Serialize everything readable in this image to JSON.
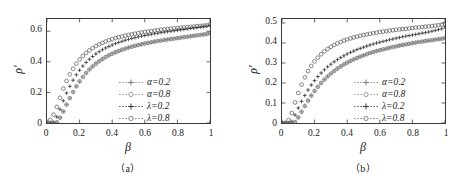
{
  "figure": {
    "background": "#ffffff",
    "axis_color": "#3a3a3a",
    "marker_dark": "#222222",
    "marker_gray": "#6f6f6f",
    "marker_open": "#555555"
  },
  "panels": [
    {
      "id": "panel-a",
      "caption": "（a）",
      "xlabel": "β",
      "ylabel": "ρ′",
      "xticks": [
        "0",
        "0.2",
        "0.4",
        "0.6",
        "0.8",
        "1"
      ],
      "yticks": [
        "0",
        "0.2",
        "0.4",
        "0.6"
      ],
      "legend": [
        {
          "label": "α=0.2",
          "marker": "plus-marker",
          "color": "#6f6f6f"
        },
        {
          "label": "α=0.8",
          "marker": "circle-marker",
          "color": "#777777"
        },
        {
          "label": "λ=0.2",
          "marker": "plus-marker",
          "color": "#222222"
        },
        {
          "label": "λ=0.8",
          "marker": "circle-marker",
          "color": "#555555"
        }
      ]
    },
    {
      "id": "panel-b",
      "caption": "（b）",
      "xlabel": "β",
      "ylabel": "ρ′",
      "xticks": [
        "0",
        "0.2",
        "0.4",
        "0.6",
        "0.8",
        "1"
      ],
      "yticks": [
        "0",
        "0.1",
        "0.2",
        "0.3",
        "0.4",
        "0.5"
      ],
      "legend": [
        {
          "label": "α=0.2",
          "marker": "plus-marker",
          "color": "#6f6f6f"
        },
        {
          "label": "α=0.8",
          "marker": "circle-marker",
          "color": "#777777"
        },
        {
          "label": "λ=0.2",
          "marker": "plus-marker",
          "color": "#222222"
        },
        {
          "label": "λ=0.8",
          "marker": "circle-marker",
          "color": "#555555"
        }
      ]
    }
  ],
  "chart_data": [
    {
      "type": "scatter",
      "panel": "a",
      "title": "（a）",
      "xlabel": "β",
      "ylabel": "ρ′",
      "xlim": [
        0,
        1
      ],
      "ylim": [
        0,
        0.68
      ],
      "xticks": [
        0,
        0.2,
        0.4,
        0.6,
        0.8,
        1
      ],
      "yticks": [
        0,
        0.2,
        0.4,
        0.6
      ],
      "grid": false,
      "legend_position": "lower-right-inside",
      "x": [
        0.0,
        0.02,
        0.04,
        0.06,
        0.08,
        0.1,
        0.12,
        0.14,
        0.16,
        0.18,
        0.2,
        0.22,
        0.24,
        0.26,
        0.28,
        0.3,
        0.32,
        0.34,
        0.36,
        0.38,
        0.4,
        0.42,
        0.44,
        0.46,
        0.48,
        0.5,
        0.52,
        0.54,
        0.56,
        0.58,
        0.6,
        0.62,
        0.64,
        0.66,
        0.68,
        0.7,
        0.72,
        0.74,
        0.76,
        0.78,
        0.8,
        0.82,
        0.84,
        0.86,
        0.88,
        0.9,
        0.92,
        0.94,
        0.96,
        0.98,
        1.0
      ],
      "series": [
        {
          "name": "λ=0.8",
          "marker": "circle",
          "color": "#555555",
          "values": [
            0.0,
            0.02,
            0.055,
            0.105,
            0.165,
            0.225,
            0.275,
            0.318,
            0.355,
            0.388,
            0.415,
            0.438,
            0.458,
            0.475,
            0.49,
            0.503,
            0.514,
            0.524,
            0.533,
            0.541,
            0.548,
            0.555,
            0.561,
            0.566,
            0.571,
            0.576,
            0.58,
            0.584,
            0.588,
            0.592,
            0.595,
            0.598,
            0.601,
            0.604,
            0.607,
            0.61,
            0.612,
            0.615,
            0.617,
            0.619,
            0.621,
            0.623,
            0.625,
            0.627,
            0.629,
            0.631,
            0.633,
            0.635,
            0.637,
            0.639,
            0.645
          ]
        },
        {
          "name": "λ=0.2",
          "marker": "plus",
          "color": "#222222",
          "values": [
            0.0,
            0.0,
            0.005,
            0.04,
            0.09,
            0.145,
            0.196,
            0.24,
            0.28,
            0.315,
            0.345,
            0.372,
            0.396,
            0.417,
            0.435,
            0.452,
            0.466,
            0.479,
            0.491,
            0.501,
            0.51,
            0.519,
            0.527,
            0.534,
            0.541,
            0.547,
            0.553,
            0.558,
            0.563,
            0.568,
            0.572,
            0.576,
            0.58,
            0.584,
            0.587,
            0.591,
            0.594,
            0.597,
            0.6,
            0.603,
            0.606,
            0.609,
            0.612,
            0.615,
            0.618,
            0.621,
            0.624,
            0.627,
            0.63,
            0.633,
            0.638
          ]
        },
        {
          "name": "α=0.2 / α=0.8",
          "marker": "plus-circle",
          "color": "#6f6f6f",
          "values": [
            0.0,
            0.0,
            0.0,
            0.005,
            0.035,
            0.075,
            0.12,
            0.163,
            0.203,
            0.24,
            0.272,
            0.301,
            0.327,
            0.35,
            0.37,
            0.388,
            0.404,
            0.418,
            0.431,
            0.443,
            0.453,
            0.463,
            0.471,
            0.479,
            0.486,
            0.493,
            0.499,
            0.505,
            0.51,
            0.515,
            0.52,
            0.524,
            0.528,
            0.532,
            0.536,
            0.539,
            0.543,
            0.546,
            0.549,
            0.552,
            0.555,
            0.558,
            0.561,
            0.564,
            0.567,
            0.57,
            0.573,
            0.576,
            0.579,
            0.582,
            0.588
          ]
        }
      ]
    },
    {
      "type": "scatter",
      "panel": "b",
      "title": "（b）",
      "xlabel": "β",
      "ylabel": "ρ′",
      "xlim": [
        0,
        1
      ],
      "ylim": [
        0,
        0.52
      ],
      "xticks": [
        0,
        0.2,
        0.4,
        0.6,
        0.8,
        1
      ],
      "yticks": [
        0,
        0.1,
        0.2,
        0.3,
        0.4,
        0.5
      ],
      "grid": false,
      "legend_position": "lower-right-inside",
      "x": [
        0.0,
        0.02,
        0.04,
        0.06,
        0.08,
        0.1,
        0.12,
        0.14,
        0.16,
        0.18,
        0.2,
        0.22,
        0.24,
        0.26,
        0.28,
        0.3,
        0.32,
        0.34,
        0.36,
        0.38,
        0.4,
        0.42,
        0.44,
        0.46,
        0.48,
        0.5,
        0.52,
        0.54,
        0.56,
        0.58,
        0.6,
        0.62,
        0.64,
        0.66,
        0.68,
        0.7,
        0.72,
        0.74,
        0.76,
        0.78,
        0.8,
        0.82,
        0.84,
        0.86,
        0.88,
        0.9,
        0.92,
        0.94,
        0.96,
        0.98,
        1.0
      ],
      "series": [
        {
          "name": "λ=0.8",
          "marker": "circle",
          "color": "#555555",
          "values": [
            0.0,
            0.0,
            0.015,
            0.05,
            0.103,
            0.15,
            0.192,
            0.228,
            0.259,
            0.285,
            0.308,
            0.327,
            0.344,
            0.358,
            0.37,
            0.381,
            0.39,
            0.398,
            0.405,
            0.412,
            0.418,
            0.423,
            0.428,
            0.432,
            0.436,
            0.44,
            0.443,
            0.446,
            0.449,
            0.452,
            0.455,
            0.457,
            0.459,
            0.462,
            0.464,
            0.466,
            0.468,
            0.47,
            0.471,
            0.473,
            0.475,
            0.477,
            0.478,
            0.48,
            0.482,
            0.483,
            0.485,
            0.487,
            0.489,
            0.491,
            0.497
          ]
        },
        {
          "name": "λ=0.2",
          "marker": "plus",
          "color": "#222222",
          "values": [
            0.0,
            0.0,
            0.0,
            0.008,
            0.04,
            0.075,
            0.108,
            0.138,
            0.165,
            0.19,
            0.212,
            0.232,
            0.25,
            0.266,
            0.281,
            0.294,
            0.306,
            0.317,
            0.327,
            0.336,
            0.345,
            0.353,
            0.36,
            0.367,
            0.373,
            0.379,
            0.385,
            0.39,
            0.395,
            0.4,
            0.404,
            0.408,
            0.412,
            0.416,
            0.42,
            0.424,
            0.427,
            0.431,
            0.434,
            0.437,
            0.44,
            0.443,
            0.446,
            0.449,
            0.452,
            0.455,
            0.459,
            0.463,
            0.467,
            0.471,
            0.48
          ]
        },
        {
          "name": "α=0.2 / α=0.8",
          "marker": "plus-circle",
          "color": "#6f6f6f",
          "values": [
            0.0,
            0.0,
            0.0,
            0.0,
            0.005,
            0.028,
            0.056,
            0.085,
            0.112,
            0.137,
            0.16,
            0.181,
            0.2,
            0.217,
            0.233,
            0.247,
            0.26,
            0.272,
            0.283,
            0.293,
            0.302,
            0.31,
            0.318,
            0.325,
            0.332,
            0.338,
            0.344,
            0.35,
            0.355,
            0.36,
            0.364,
            0.368,
            0.372,
            0.376,
            0.38,
            0.383,
            0.387,
            0.39,
            0.393,
            0.396,
            0.399,
            0.402,
            0.405,
            0.407,
            0.41,
            0.412,
            0.414,
            0.417,
            0.419,
            0.421,
            0.425
          ]
        }
      ]
    }
  ]
}
